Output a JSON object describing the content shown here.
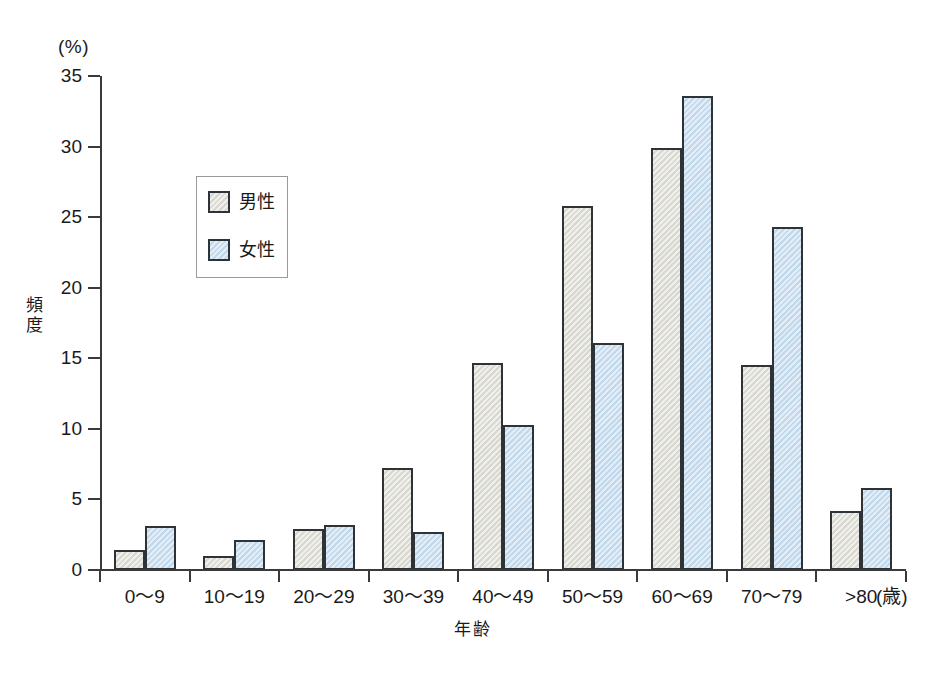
{
  "chart_data": {
    "type": "bar",
    "title": "",
    "xlabel": "年齢",
    "ylabel": "頻度",
    "y_unit": "(%)",
    "x_unit": "(歳)",
    "categories": [
      "0〜9",
      "10〜19",
      "20〜29",
      "30〜39",
      "40〜49",
      "50〜59",
      "60〜69",
      "70〜79",
      ">80"
    ],
    "series": [
      {
        "name": "男性",
        "color": "#dcdcd4",
        "values": [
          1.4,
          1.0,
          2.9,
          7.2,
          14.7,
          25.8,
          29.9,
          14.5,
          4.2
        ]
      },
      {
        "name": "女性",
        "color": "#c6dcf0",
        "values": [
          3.1,
          2.1,
          3.2,
          2.7,
          10.3,
          16.1,
          33.6,
          24.3,
          5.8
        ]
      }
    ],
    "ylim": [
      0,
      35
    ],
    "yticks": [
      0,
      5,
      10,
      15,
      20,
      25,
      30,
      35
    ],
    "ytick_labels": [
      "0",
      "5",
      "10",
      "15",
      "20",
      "25",
      "30",
      "35"
    ],
    "grid": false,
    "legend_position": "upper-left-inset"
  },
  "legend": {
    "entries": [
      {
        "label": "男性",
        "color": "#dcdcd4"
      },
      {
        "label": "女性",
        "color": "#c6dcf0"
      }
    ]
  },
  "axes": {
    "y_unit_label": "(%)",
    "y_title_chars": [
      "頻",
      "度"
    ],
    "x_title": "年齢",
    "x_unit_label": "(歳)"
  },
  "colors": {
    "male_fill": "#dcdcd4",
    "female_fill": "#c6dcf0",
    "bar_stroke": "#2e3338",
    "axis": "#3a3a3a",
    "background": "#ffffff"
  }
}
